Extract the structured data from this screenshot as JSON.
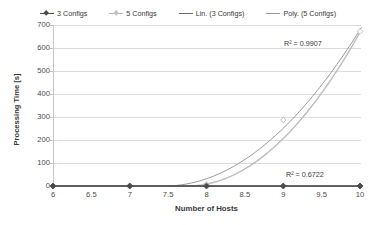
{
  "chart_data": {
    "type": "line",
    "title": "",
    "xlabel": "Number of Hosts",
    "ylabel": "Processing Time [s]",
    "xlim": [
      6,
      10
    ],
    "ylim": [
      0,
      700
    ],
    "xticks": [
      "6",
      "6.5",
      "7",
      "7.5",
      "8",
      "8.5",
      "9",
      "9.5",
      "10"
    ],
    "yticks": [
      "0",
      "100",
      "200",
      "300",
      "400",
      "500",
      "600",
      "700"
    ],
    "grid": true,
    "legend_position": "top-center",
    "x": [
      6,
      7,
      8,
      9,
      10
    ],
    "series": [
      {
        "name": "3 Configs",
        "values": [
          0,
          0,
          0,
          0,
          0
        ],
        "color": "#4a4a4a",
        "marker": "diamond"
      },
      {
        "name": "5 Configs",
        "values": [
          0,
          0,
          8,
          287,
          672
        ],
        "color": "#bdbdbd",
        "marker": "diamond"
      }
    ],
    "trendlines": [
      {
        "name": "Lin. (3 Configs)",
        "color": "#6e6e6e",
        "r_squared": "R² = 0.6722",
        "r_squared_value": 0.6722
      },
      {
        "name": "Poly. (5 Configs)",
        "color": "#9a9a9a",
        "r_squared": "R² = 0.9907",
        "r_squared_value": 0.9907
      }
    ],
    "annotations": [
      {
        "text": "R² = 0.9907",
        "x": 9.6,
        "y": 635
      },
      {
        "text": "R² = 0.6722",
        "x": 9.6,
        "y": 70
      }
    ]
  },
  "legend": {
    "items": [
      {
        "label": "3 Configs"
      },
      {
        "label": "5 Configs"
      },
      {
        "label": "Lin. (3 Configs)"
      },
      {
        "label": "Poly. (5 Configs)"
      }
    ]
  },
  "axes": {
    "y_title": "Processing Time [s]",
    "x_title": "Number of Hosts",
    "y_tick_labels": [
      "700",
      "600",
      "500",
      "400",
      "300",
      "200",
      "100",
      "0"
    ],
    "x_tick_labels": [
      "6",
      "6.5",
      "7",
      "7.5",
      "8",
      "8.5",
      "9",
      "9.5",
      "10"
    ]
  },
  "annotations": {
    "r2_poly": "R² = 0.9907",
    "r2_lin": "R² = 0.6722"
  }
}
